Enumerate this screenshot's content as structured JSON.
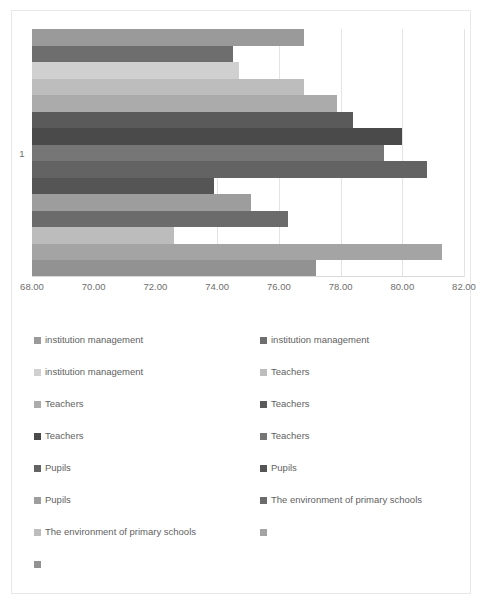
{
  "chart_data": {
    "type": "bar",
    "orientation": "horizontal",
    "title": "",
    "subtitle": "",
    "xlabel": "",
    "ylabel": "",
    "categories": [
      "1"
    ],
    "xlim": [
      68.0,
      82.0
    ],
    "xticks": [
      68.0,
      70.0,
      72.0,
      74.0,
      76.0,
      78.0,
      80.0,
      82.0
    ],
    "xtick_labels": [
      "68.00",
      "70.00",
      "72.00",
      "74.00",
      "76.00",
      "78.00",
      "80.00",
      "82.00"
    ],
    "grid": true,
    "legend_position": "bottom",
    "series": [
      {
        "name": "institution management",
        "value": 76.8,
        "color": "#9a9a9a"
      },
      {
        "name": "institution management",
        "value": 74.5,
        "color": "#6e6e6e"
      },
      {
        "name": "institution management",
        "value": 74.7,
        "color": "#d0d0d0"
      },
      {
        "name": "Teachers",
        "value": 76.8,
        "color": "#bdbdbd"
      },
      {
        "name": "Teachers",
        "value": 77.9,
        "color": "#ababab"
      },
      {
        "name": "Teachers",
        "value": 78.4,
        "color": "#5a5a5a"
      },
      {
        "name": "Teachers",
        "value": 80.0,
        "color": "#4a4a4a"
      },
      {
        "name": "Teachers",
        "value": 79.4,
        "color": "#767676"
      },
      {
        "name": "Pupils",
        "value": 80.8,
        "color": "#636363"
      },
      {
        "name": "Pupils",
        "value": 73.9,
        "color": "#555555"
      },
      {
        "name": "Pupils",
        "value": 75.1,
        "color": "#9d9d9d"
      },
      {
        "name": "The environment of primary schools",
        "value": 76.3,
        "color": "#6b6b6b"
      },
      {
        "name": "The environment of primary schools",
        "value": 72.6,
        "color": "#bcbcbc"
      },
      {
        "name": "",
        "value": 81.3,
        "color": "#a4a4a4"
      },
      {
        "name": "",
        "value": 77.2,
        "color": "#929292"
      }
    ]
  },
  "legend": {
    "items": [
      {
        "label": "institution management",
        "color": "#9a9a9a"
      },
      {
        "label": "institution management",
        "color": "#6e6e6e"
      },
      {
        "label": "institution management",
        "color": "#d0d0d0"
      },
      {
        "label": "Teachers",
        "color": "#bdbdbd"
      },
      {
        "label": "Teachers",
        "color": "#ababab"
      },
      {
        "label": "Teachers",
        "color": "#5a5a5a"
      },
      {
        "label": "Teachers",
        "color": "#4a4a4a"
      },
      {
        "label": "Teachers",
        "color": "#767676"
      },
      {
        "label": "Pupils",
        "color": "#636363"
      },
      {
        "label": "Pupils",
        "color": "#555555"
      },
      {
        "label": "Pupils",
        "color": "#9d9d9d"
      },
      {
        "label": "The environment of primary schools",
        "color": "#6b6b6b"
      },
      {
        "label": "The environment of primary schools",
        "color": "#bcbcbc"
      },
      {
        "label": "",
        "color": "#a4a4a4"
      },
      {
        "label": "",
        "color": "#929292"
      }
    ]
  },
  "colors": {
    "plot_background": "#ffffff",
    "gridline": "#e3e3e3",
    "axis_line": "#d9d9d9",
    "tick_text": "#6e6e6e",
    "legend_text": "#5f5f5f",
    "frame_border": "#e8e8e8"
  }
}
